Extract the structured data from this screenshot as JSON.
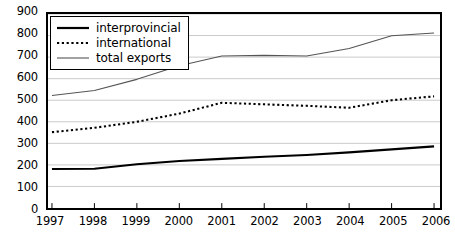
{
  "chart_data": {
    "type": "line",
    "title": "",
    "xlabel": "",
    "ylabel": "",
    "categories": [
      "1997",
      "1998",
      "1999",
      "2000",
      "2001",
      "2002",
      "2003",
      "2004",
      "2005",
      "2006"
    ],
    "xlim": [
      1997,
      2006
    ],
    "ylim": [
      0,
      900
    ],
    "y_ticks": [
      0,
      100,
      200,
      300,
      400,
      500,
      600,
      700,
      800,
      900
    ],
    "grid": "horizontal",
    "legend_position": "top-left",
    "series": [
      {
        "name": "interprovincial",
        "style": "solid-thick",
        "color": "#000000",
        "values": [
          181,
          182,
          203,
          218,
          228,
          238,
          246,
          258,
          272,
          286
        ]
      },
      {
        "name": "international",
        "style": "dotted",
        "color": "#000000",
        "values": [
          352,
          372,
          400,
          438,
          488,
          481,
          474,
          465,
          500,
          518
        ]
      },
      {
        "name": "total exports",
        "style": "solid-thin",
        "color": "#555555",
        "values": [
          522,
          545,
          597,
          660,
          705,
          708,
          705,
          740,
          799,
          812
        ]
      }
    ]
  },
  "axes": {
    "y_tick_labels": [
      "900",
      "800",
      "700",
      "600",
      "500",
      "400",
      "300",
      "200",
      "100",
      "0"
    ],
    "x_tick_labels": [
      "1997",
      "1998",
      "1999",
      "2000",
      "2001",
      "2002",
      "2003",
      "2004",
      "2005",
      "2006"
    ]
  },
  "legend": {
    "items": [
      {
        "label": "interprovincial",
        "marker": "solid-thick-line-swatch"
      },
      {
        "label": "international",
        "marker": "dotted-line-swatch"
      },
      {
        "label": "total exports",
        "marker": "solid-thin-line-swatch"
      }
    ]
  }
}
